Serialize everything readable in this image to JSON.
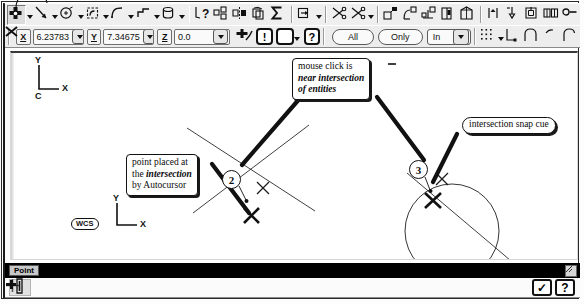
{
  "app": {
    "title": "CAD Point Placement - Autocursor Intersection"
  },
  "toolbar_row1": {
    "items": [
      {
        "name": "point-tool",
        "icon": "point-cross-icon",
        "state": "pressed",
        "has_dropdown": true
      },
      {
        "name": "line-tool",
        "icon": "line-icon",
        "has_dropdown": true
      },
      {
        "name": "arc-tool",
        "icon": "arc-center-icon",
        "has_dropdown": true
      },
      {
        "name": "fillet-tool",
        "icon": "fillet-box-icon",
        "has_dropdown": true
      },
      {
        "name": "spline-tool",
        "icon": "curve-icon",
        "has_dropdown": true
      },
      {
        "name": "rectangle-tool",
        "icon": "rectangle-shape-icon",
        "has_dropdown": true
      },
      {
        "name": "cylinder-tool",
        "icon": "cylinder-icon",
        "has_dropdown": true
      },
      {
        "name": "analyze-tool",
        "icon": "analyze-question-icon"
      },
      {
        "name": "xform-translate",
        "icon": "translate-grid-icon"
      },
      {
        "name": "xform-mirror",
        "icon": "mirror-icon"
      },
      {
        "name": "xform-rotate",
        "icon": "rotate-box-icon"
      },
      {
        "name": "sum-tool",
        "icon": "sigma-icon"
      },
      {
        "name": "drafting-tool",
        "icon": "dimension-arrow-icon",
        "has_dropdown": true
      },
      {
        "name": "trim-one-tool",
        "icon": "scissors-icon"
      },
      {
        "name": "trim-two-tool",
        "icon": "scissors-two-icon",
        "has_dropdown": true
      },
      {
        "name": "solid-extrude",
        "icon": "extrude-icon"
      },
      {
        "name": "solid-revolve",
        "icon": "revolve-icon"
      },
      {
        "name": "solid-sweep",
        "icon": "sweep-icon"
      },
      {
        "name": "solid-loft",
        "icon": "loft-icon"
      },
      {
        "name": "solid-shell",
        "icon": "shell-icon"
      },
      {
        "name": "machine-contour",
        "icon": "contour-toolpath-icon"
      },
      {
        "name": "machine-drill",
        "icon": "drill-toolpath-icon"
      },
      {
        "name": "machine-pocket",
        "icon": "pocket-toolpath-icon"
      },
      {
        "name": "machine-surface",
        "icon": "surface-toolpath-icon"
      },
      {
        "name": "machine-chain",
        "icon": "chain-link-icon"
      }
    ]
  },
  "toolbar_row2": {
    "coords": [
      {
        "name": "x-coordinate",
        "label": "X",
        "value": "6.23783",
        "has_dropdown": true
      },
      {
        "name": "y-coordinate",
        "label": "Y",
        "value": "7.34675",
        "has_dropdown": true
      },
      {
        "name": "z-coordinate",
        "label": "Z",
        "value": "0.0",
        "has_dropdown": true
      }
    ],
    "gnomon_button": {
      "name": "autocursor-gnomon-button",
      "icon": "gnomon-snap-icon"
    },
    "alert_button": {
      "name": "autocursor-settings-button",
      "icon": "exclamation-icon",
      "glyph": "!"
    },
    "xhair_button": {
      "name": "autocursor-crosshair-button",
      "icon": "crosshair-x-icon",
      "has_dropdown": true
    },
    "help_button": {
      "name": "help-button",
      "icon": "question-icon",
      "glyph": "?"
    },
    "all_button": {
      "name": "select-all-button",
      "label": "All"
    },
    "only_button": {
      "name": "select-only-button",
      "label": "Only"
    },
    "mask_select": {
      "name": "selection-mask-select",
      "value": "In"
    },
    "grid_button": {
      "name": "grid-snap-button",
      "icon": "grid-dots-icon",
      "has_dropdown": true
    },
    "extra": [
      {
        "name": "endpoint-snap-button",
        "icon": "endpoint-snap-icon"
      },
      {
        "name": "arc-snap-button",
        "icon": "arc-snap-icon"
      },
      {
        "name": "tangent-snap-button",
        "icon": "tangent-snap-icon"
      },
      {
        "name": "quadrant-snap-button",
        "icon": "quadrant-snap-icon"
      }
    ]
  },
  "canvas": {
    "view_gnomon": {
      "name": "construction-plane-gnomon",
      "y_label": "Y",
      "x_label": "X",
      "plane_label": "C"
    },
    "wcs_gnomon": {
      "name": "wcs-gnomon",
      "chip": "WCS",
      "y_label": "Y",
      "x_label": "X"
    },
    "markers": [
      {
        "name": "step-marker-2",
        "number": "2"
      },
      {
        "name": "step-marker-3",
        "number": "3"
      }
    ],
    "callouts": [
      {
        "name": "callout-mouse-click",
        "lines": [
          "mouse click is",
          "near intersection",
          "of entities"
        ],
        "emphasis": [
          false,
          true,
          true
        ]
      },
      {
        "name": "callout-point-placed",
        "lines": [
          "point placed at",
          "the intersection",
          "by Autocursor"
        ]
      },
      {
        "name": "callout-snap-cue",
        "lines": [
          "intersection snap cue"
        ]
      }
    ]
  },
  "statusbar": {
    "prompt": "Point",
    "corner_icon": "resize-grip-icon"
  },
  "bottombar": {
    "crosshair_button": {
      "name": "crosshair-mode-button",
      "icon": "crosshair-plus-icon"
    },
    "point_entry_button": {
      "name": "point-entry-button",
      "icon": "point-entry-1-icon"
    },
    "ok_button": {
      "name": "ok-button",
      "icon": "checkmark-icon",
      "glyph": "✓"
    },
    "help_button": {
      "name": "bottom-help-button",
      "icon": "question-icon",
      "glyph": "?"
    }
  },
  "colors": {
    "ink": "#111111",
    "panel": "#efefef",
    "canvas": "#ffffff",
    "statusbar": "#000000"
  }
}
